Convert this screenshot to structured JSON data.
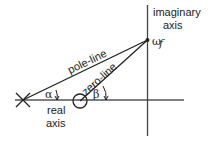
{
  "diagram": {
    "labels": {
      "imaginary_axis_line1": "imaginary",
      "imaginary_axis_line2": "axis",
      "real_axis_line1": "real",
      "real_axis_line2": "axis",
      "pole_line": "pole-line",
      "zero_line": "zero-line",
      "alpha": "α",
      "beta": "β",
      "omega": "ω",
      "omega_sub": "f"
    },
    "colors": {
      "stroke": "#222222",
      "axis": "#555555"
    }
  }
}
